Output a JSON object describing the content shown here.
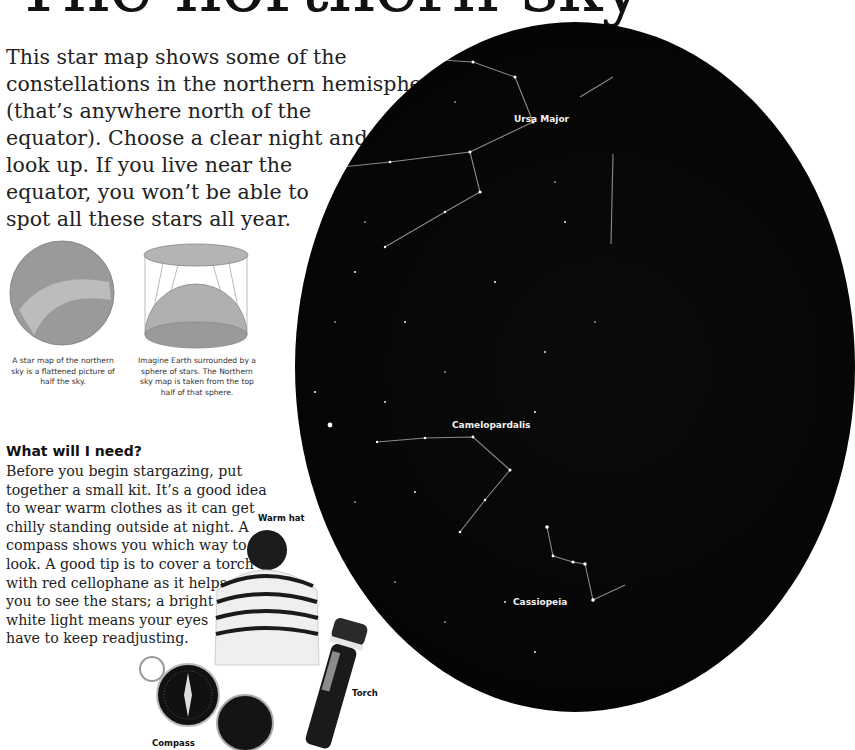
{
  "page": {
    "title": "The northern sky",
    "intro_lines": [
      "This star map shows some of the",
      "constellations in the northern hemisphere",
      "(that’s anywhere north of the",
      "equator). Choose a clear night and",
      "look up. If you live near the",
      "equator, you won’t be able to",
      "spot all these stars all year."
    ]
  },
  "diagrams": [
    {
      "name": "flattened-star-map",
      "caption_lines": [
        "A star map of the northern",
        "sky is a flattened picture of",
        "half the sky."
      ]
    },
    {
      "name": "sky-sphere-projection",
      "caption_lines": [
        "Imagine Earth surrounded by a",
        "sphere of stars. The Northern",
        "sky map is taken from the top",
        "half of that sphere."
      ]
    }
  ],
  "kit_section": {
    "heading": "What will I need?",
    "body_lines": [
      "Before you begin stargazing, put",
      "together a small kit. It’s a good idea",
      "to wear warm clothes as it can get",
      "chilly standing outside at night. A",
      "compass shows you which way to",
      "look. A good tip is to cover a torch",
      "with red cellophane as it helps",
      "you to see the stars; a bright",
      "white light means your eyes",
      "have to keep readjusting."
    ],
    "items": [
      {
        "label": "Warm hat",
        "icon": "hat-icon"
      },
      {
        "label": "Torch",
        "icon": "torch-icon"
      },
      {
        "label": "Compass",
        "icon": "compass-icon"
      }
    ]
  },
  "star_map": {
    "constellations": [
      {
        "name": "Ursa Major"
      },
      {
        "name": "Camelopardalis"
      },
      {
        "name": "Cassiopeia"
      }
    ],
    "colors": {
      "sky": "#050505",
      "star": "#ffffff",
      "line": "#8a8a8a"
    }
  }
}
